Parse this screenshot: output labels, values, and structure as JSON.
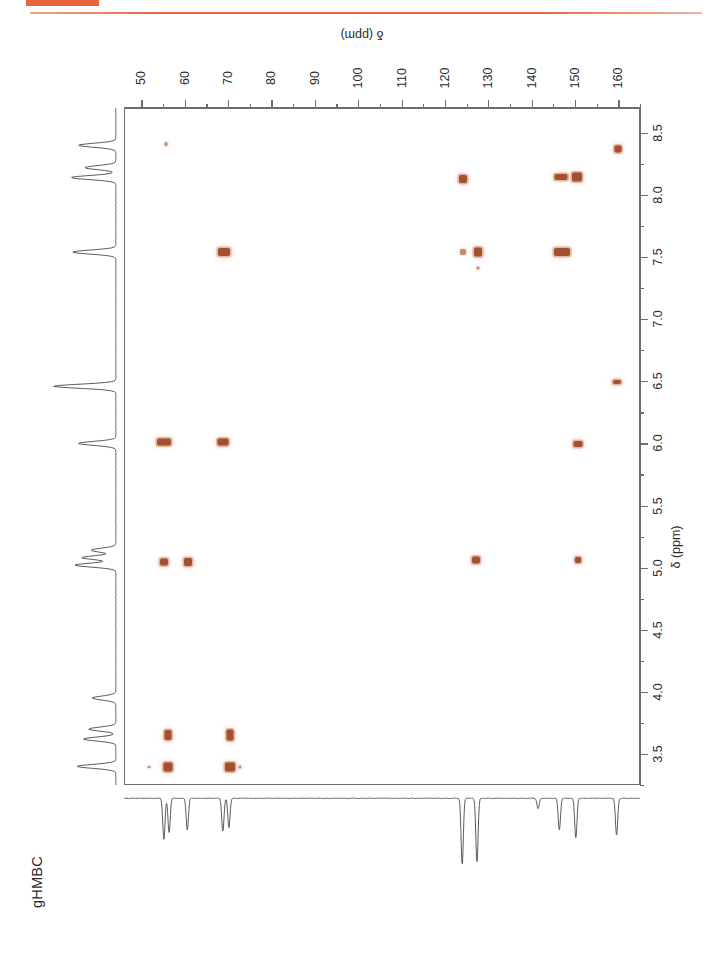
{
  "figure": {
    "title": "gHMBC",
    "accent_color": "#e8643c",
    "peak_color": "#a2502f"
  },
  "chart_data": {
    "type": "scatter",
    "title": "gHMBC",
    "subtitle": "",
    "xlabel": "δ (ppm)",
    "ylabel": "δ (ppm)",
    "xlim": [
      46,
      165
    ],
    "ylim": [
      8.7,
      3.25
    ],
    "x_axis_position": "top",
    "y_axis_position": "right",
    "x_inverted": false,
    "y_inverted": true,
    "grid": false,
    "legend": false,
    "x_ticks": [
      50,
      60,
      70,
      80,
      90,
      100,
      110,
      120,
      130,
      140,
      150,
      160
    ],
    "x_tick_labels": [
      "50",
      "60",
      "70",
      "80",
      "90",
      "100",
      "110",
      "120",
      "130",
      "140",
      "150",
      "160"
    ],
    "x_minor_step": 5,
    "y_ticks": [
      3.5,
      4.0,
      4.5,
      5.0,
      5.5,
      6.0,
      6.5,
      7.0,
      7.5,
      8.0,
      8.5
    ],
    "y_tick_labels": [
      "3.5",
      "4.0",
      "4.5",
      "5.0",
      "5.5",
      "6.0",
      "6.5",
      "7.0",
      "7.5",
      "8.0",
      "8.5"
    ],
    "y_minor_step": 0.25,
    "points": [
      {
        "c": 56.0,
        "h": 3.4,
        "w": 9,
        "hgt": 9,
        "intensity": "strong"
      },
      {
        "c": 70.3,
        "h": 3.4,
        "w": 10,
        "hgt": 9,
        "intensity": "strong"
      },
      {
        "c": 72.5,
        "h": 3.4,
        "w": 3,
        "hgt": 3,
        "intensity": "weak"
      },
      {
        "c": 51.5,
        "h": 3.4,
        "w": 3,
        "hgt": 2,
        "intensity": "weak"
      },
      {
        "c": 56.0,
        "h": 3.66,
        "w": 7,
        "hgt": 10,
        "intensity": "medium"
      },
      {
        "c": 70.3,
        "h": 3.66,
        "w": 7,
        "hgt": 11,
        "intensity": "medium"
      },
      {
        "c": 55.0,
        "h": 5.05,
        "w": 8,
        "hgt": 7,
        "intensity": "medium"
      },
      {
        "c": 60.5,
        "h": 5.05,
        "w": 8,
        "hgt": 8,
        "intensity": "medium"
      },
      {
        "c": 127.0,
        "h": 5.07,
        "w": 8,
        "hgt": 7,
        "intensity": "strong"
      },
      {
        "c": 150.5,
        "h": 5.07,
        "w": 6,
        "hgt": 6,
        "intensity": "medium"
      },
      {
        "c": 55.0,
        "h": 6.02,
        "w": 14,
        "hgt": 7,
        "intensity": "strong"
      },
      {
        "c": 68.5,
        "h": 6.02,
        "w": 11,
        "hgt": 7,
        "intensity": "medium"
      },
      {
        "c": 150.5,
        "h": 6.0,
        "w": 9,
        "hgt": 6,
        "intensity": "medium"
      },
      {
        "c": 159.5,
        "h": 6.5,
        "w": 8,
        "hgt": 4,
        "intensity": "medium"
      },
      {
        "c": 127.5,
        "h": 7.42,
        "w": 3,
        "hgt": 3,
        "intensity": "weak"
      },
      {
        "c": 68.8,
        "h": 7.55,
        "w": 12,
        "hgt": 8,
        "intensity": "strong"
      },
      {
        "c": 124.0,
        "h": 7.55,
        "w": 6,
        "hgt": 6,
        "intensity": "weak"
      },
      {
        "c": 127.5,
        "h": 7.55,
        "w": 8,
        "hgt": 9,
        "intensity": "strong"
      },
      {
        "c": 146.8,
        "h": 7.55,
        "w": 16,
        "hgt": 8,
        "intensity": "strong"
      },
      {
        "c": 124.0,
        "h": 8.14,
        "w": 8,
        "hgt": 8,
        "intensity": "strong"
      },
      {
        "c": 146.5,
        "h": 8.15,
        "w": 13,
        "hgt": 6,
        "intensity": "strong"
      },
      {
        "c": 150.3,
        "h": 8.15,
        "w": 10,
        "hgt": 9,
        "intensity": "strong"
      },
      {
        "c": 55.5,
        "h": 8.42,
        "w": 3,
        "hgt": 4,
        "intensity": "weak"
      },
      {
        "c": 159.8,
        "h": 8.38,
        "w": 7,
        "hgt": 7,
        "intensity": "medium"
      }
    ],
    "proton_projection": {
      "axis": "left",
      "label": "1H projection",
      "peaks": [
        {
          "shift": 3.4,
          "height": 0.62
        },
        {
          "shift": 3.62,
          "height": 0.52
        },
        {
          "shift": 3.7,
          "height": 0.44
        },
        {
          "shift": 3.95,
          "height": 0.38
        },
        {
          "shift": 5.02,
          "height": 0.66
        },
        {
          "shift": 5.08,
          "height": 0.55
        },
        {
          "shift": 5.14,
          "height": 0.4
        },
        {
          "shift": 6.0,
          "height": 0.6
        },
        {
          "shift": 6.46,
          "height": 1.0
        },
        {
          "shift": 7.54,
          "height": 0.7
        },
        {
          "shift": 8.14,
          "height": 0.72
        },
        {
          "shift": 8.22,
          "height": 0.5
        },
        {
          "shift": 8.4,
          "height": 0.6
        }
      ]
    },
    "carbon_projection": {
      "axis": "bottom",
      "label": "13C projection",
      "direction": "down",
      "peaks": [
        {
          "shift": 55.2,
          "height": 0.62
        },
        {
          "shift": 56.4,
          "height": 0.52
        },
        {
          "shift": 60.6,
          "height": 0.48
        },
        {
          "shift": 68.8,
          "height": 0.5
        },
        {
          "shift": 70.2,
          "height": 0.44
        },
        {
          "shift": 124.0,
          "height": 1.0
        },
        {
          "shift": 127.4,
          "height": 0.96
        },
        {
          "shift": 141.5,
          "height": 0.16
        },
        {
          "shift": 146.4,
          "height": 0.48
        },
        {
          "shift": 150.2,
          "height": 0.6
        },
        {
          "shift": 159.6,
          "height": 0.56
        }
      ]
    }
  }
}
